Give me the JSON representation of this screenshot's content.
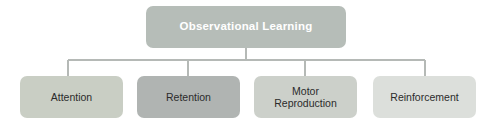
{
  "diagram": {
    "type": "hierarchy-tree",
    "title": "Observational Learning",
    "background_color": "#ffffff",
    "connector_color": "#b5b9b6",
    "root": {
      "label": "Observational Learning",
      "fill_color": "#b6bdb8",
      "text_color": "#ffffff"
    },
    "children": [
      {
        "label": "Attention",
        "fill_color": "#c9cec4",
        "text_color": "#2b2b2b"
      },
      {
        "label": "Retention",
        "fill_color": "#b0b4b2",
        "text_color": "#2b2b2b"
      },
      {
        "label": "Motor\nReproduction",
        "fill_color": "#ccd0ca",
        "text_color": "#2b2b2b"
      },
      {
        "label": "Reinforcement",
        "fill_color": "#dcdfdb",
        "text_color": "#2b2b2b"
      }
    ]
  }
}
